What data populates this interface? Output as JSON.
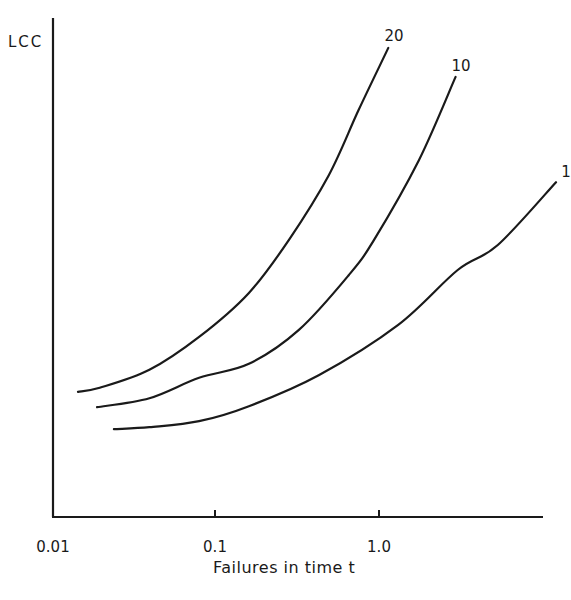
{
  "chart_data": {
    "type": "line",
    "title": "",
    "xlabel": "Failures in time t",
    "ylabel": "LCC",
    "xscale": "log",
    "xlim": [
      0.01,
      10
    ],
    "ylim": [
      0,
      100
    ],
    "x_ticks": [
      0.01,
      0.1,
      1.0
    ],
    "x_tick_labels": [
      "0.01",
      "0.1",
      "1.0"
    ],
    "y_ticks": [],
    "grid": false,
    "legend": "inline curve labels at right end",
    "series": [
      {
        "name": "20",
        "x": [
          0.0146,
          0.0198,
          0.0398,
          0.08,
          0.161,
          0.282,
          0.494,
          0.752,
          1.14
        ],
        "y": [
          25.1,
          25.9,
          29.5,
          36.1,
          44.9,
          55.5,
          68.5,
          81.6,
          94.0
        ]
      },
      {
        "name": "10",
        "x": [
          0.0191,
          0.0398,
          0.08,
          0.161,
          0.325,
          0.655,
          0.931,
          1.75,
          2.93
        ],
        "y": [
          22.0,
          23.8,
          27.9,
          30.7,
          37.5,
          48.5,
          55.5,
          71.5,
          88.2
        ]
      },
      {
        "name": "1",
        "x": [
          0.0242,
          0.0398,
          0.08,
          0.161,
          0.429,
          1.31,
          3.02,
          5.3,
          12.0
        ],
        "y": [
          17.6,
          18.0,
          19.2,
          22.2,
          28.4,
          38.5,
          49.5,
          54.5,
          67.1
        ]
      }
    ]
  },
  "axes": {
    "y_label": "LCC",
    "x_label": "Failures in time t",
    "x_tick_labels": [
      "0.01",
      "0.1",
      "1.0"
    ]
  },
  "curve_labels": [
    "20",
    "10",
    "1"
  ]
}
